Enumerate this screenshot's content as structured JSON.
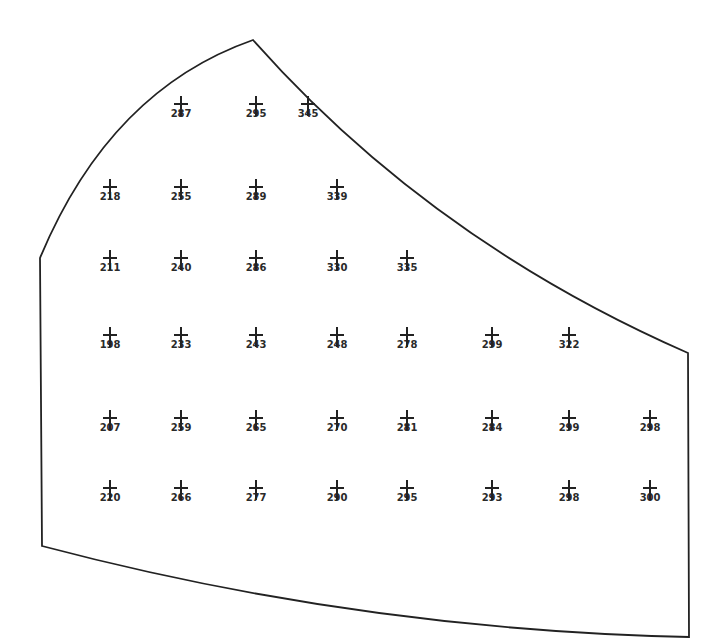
{
  "diagram": {
    "type": "spot-measurement-map",
    "boundary_color": "#222222",
    "marker": "plus-cross",
    "rows": [
      {
        "y": 110,
        "points": [
          {
            "x": 181,
            "value": "287"
          },
          {
            "x": 256,
            "value": "295"
          },
          {
            "x": 308,
            "value": "345"
          }
        ]
      },
      {
        "y": 193,
        "points": [
          {
            "x": 110,
            "value": "218"
          },
          {
            "x": 181,
            "value": "255"
          },
          {
            "x": 256,
            "value": "289"
          },
          {
            "x": 337,
            "value": "339"
          }
        ]
      },
      {
        "y": 264,
        "points": [
          {
            "x": 110,
            "value": "211"
          },
          {
            "x": 181,
            "value": "240"
          },
          {
            "x": 256,
            "value": "286"
          },
          {
            "x": 337,
            "value": "330"
          },
          {
            "x": 407,
            "value": "335"
          }
        ]
      },
      {
        "y": 341,
        "points": [
          {
            "x": 110,
            "value": "198"
          },
          {
            "x": 181,
            "value": "233"
          },
          {
            "x": 256,
            "value": "243"
          },
          {
            "x": 337,
            "value": "248"
          },
          {
            "x": 407,
            "value": "278"
          },
          {
            "x": 492,
            "value": "299"
          },
          {
            "x": 569,
            "value": "322"
          }
        ]
      },
      {
        "y": 424,
        "points": [
          {
            "x": 110,
            "value": "207"
          },
          {
            "x": 181,
            "value": "259"
          },
          {
            "x": 256,
            "value": "265"
          },
          {
            "x": 337,
            "value": "270"
          },
          {
            "x": 407,
            "value": "281"
          },
          {
            "x": 492,
            "value": "284"
          },
          {
            "x": 569,
            "value": "299"
          },
          {
            "x": 650,
            "value": "298"
          }
        ]
      },
      {
        "y": 494,
        "points": [
          {
            "x": 110,
            "value": "220"
          },
          {
            "x": 181,
            "value": "266"
          },
          {
            "x": 256,
            "value": "277"
          },
          {
            "x": 337,
            "value": "290"
          },
          {
            "x": 407,
            "value": "295"
          },
          {
            "x": 492,
            "value": "293"
          },
          {
            "x": 569,
            "value": "298"
          },
          {
            "x": 650,
            "value": "300"
          }
        ]
      }
    ]
  }
}
